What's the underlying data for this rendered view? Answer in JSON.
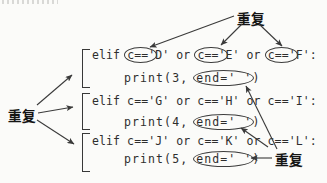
{
  "labels": {
    "repeat_top": "重复",
    "repeat_left": "重复",
    "repeat_right": "重复"
  },
  "annotation_color": "#3a3a3a",
  "code": {
    "line1": {
      "s0": "elif ",
      "c0": "c=='",
      "s1": "D' or ",
      "c1": "c=='",
      "s2": "E' or ",
      "c2": "c=='",
      "s3": "F':"
    },
    "line2": {
      "s0": "print(3, ",
      "c0": "end=' '",
      "s1": ")"
    },
    "line3": {
      "s0": "elif c=='G' or c=='H' or c=='I':"
    },
    "line4": {
      "s0": "print(4, ",
      "c0": "end=' '",
      "s1": ")"
    },
    "line5": {
      "s0": "elif c=='J' or c=='K' or c=='L':"
    },
    "line6": {
      "s0": "print(5, ",
      "c0": "end=' '",
      "s1": ")"
    }
  }
}
